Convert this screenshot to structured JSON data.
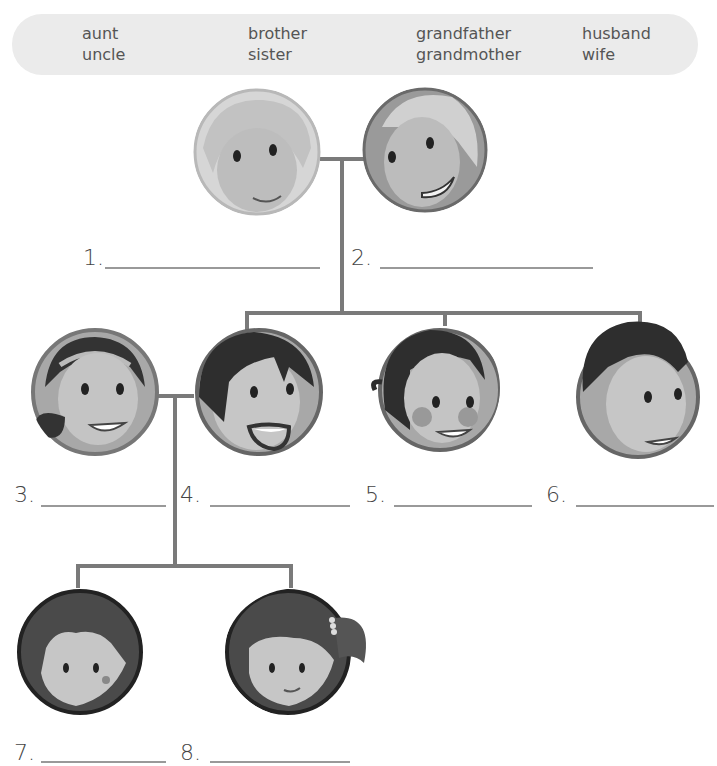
{
  "word_bank": {
    "col1": [
      "aunt",
      "uncle"
    ],
    "col2": [
      "brother",
      "sister"
    ],
    "col3": [
      "grandfather",
      "grandmother"
    ],
    "col4": [
      "husband",
      "wife"
    ]
  },
  "people": [
    {
      "number": "1.",
      "answer": ""
    },
    {
      "number": "2.",
      "answer": ""
    },
    {
      "number": "3.",
      "answer": ""
    },
    {
      "number": "4.",
      "answer": ""
    },
    {
      "number": "5.",
      "answer": ""
    },
    {
      "number": "6.",
      "answer": ""
    },
    {
      "number": "7.",
      "answer": ""
    },
    {
      "number": "8.",
      "answer": ""
    }
  ],
  "colors": {
    "connector": "#7a7a7a",
    "wordbank_bg": "#ebebeb",
    "blank_line": "#999999"
  }
}
